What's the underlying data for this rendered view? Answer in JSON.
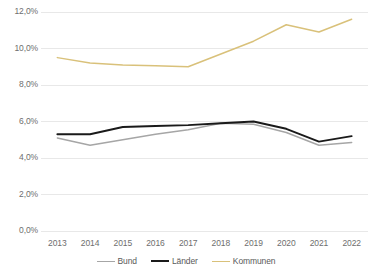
{
  "chart_data": {
    "type": "line",
    "title": "",
    "subtitle": "",
    "xlabel": "",
    "ylabel": "",
    "categories": [
      "2013",
      "2014",
      "2015",
      "2016",
      "2017",
      "2018",
      "2019",
      "2020",
      "2021",
      "2022"
    ],
    "series": [
      {
        "name": "Bund",
        "color": "#a6a6a6",
        "values": [
          5.1,
          4.7,
          5.0,
          5.3,
          5.55,
          5.9,
          5.85,
          5.4,
          4.7,
          4.85
        ]
      },
      {
        "name": "Länder",
        "color": "#1a1a1a",
        "values": [
          5.3,
          5.3,
          5.7,
          5.75,
          5.8,
          5.9,
          6.0,
          5.6,
          4.9,
          5.2
        ]
      },
      {
        "name": "Kommunen",
        "color": "#d9c17a",
        "values": [
          9.5,
          9.2,
          9.1,
          9.05,
          9.0,
          9.7,
          10.4,
          11.3,
          10.9,
          11.6
        ]
      }
    ],
    "ylim": [
      0,
      12
    ],
    "yticks": [
      0,
      2,
      4,
      6,
      8,
      10,
      12
    ],
    "ytick_labels": [
      "0,0%",
      "2,0%",
      "4,0%",
      "6,0%",
      "8,0%",
      "10,0%",
      "12,0%"
    ],
    "grid": true,
    "grid_color": "#e8e8e8",
    "legend_position": "bottom",
    "background_color": "#ffffff",
    "axis_text_color": "#6e6e6e"
  },
  "legend": {
    "items": [
      {
        "label": "Bund"
      },
      {
        "label": "Länder"
      },
      {
        "label": "Kommunen"
      }
    ]
  }
}
